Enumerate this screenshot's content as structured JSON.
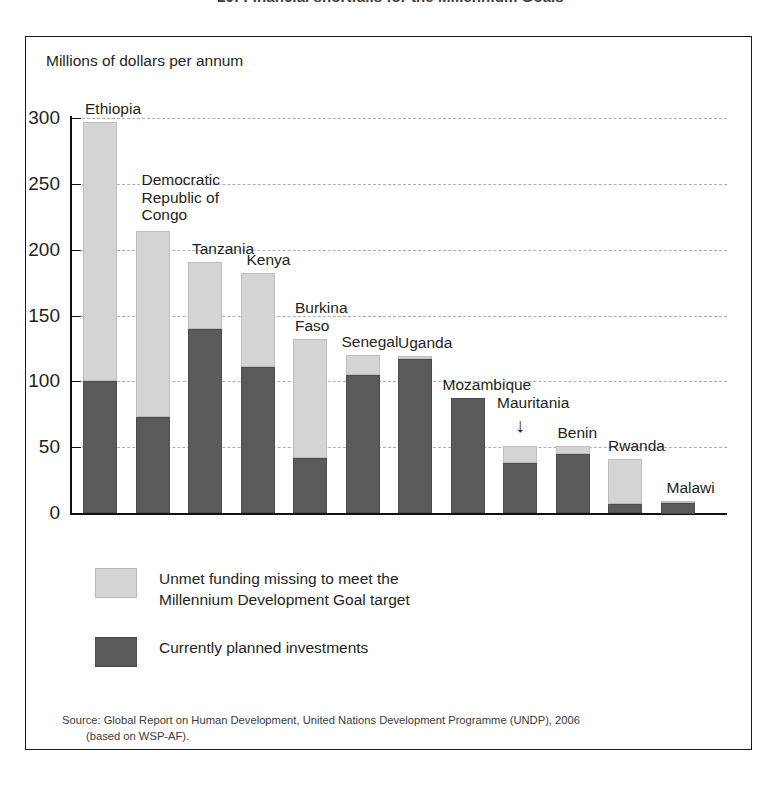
{
  "figure": {
    "title": "20: Financial shortfalls for the Millennium Goals",
    "axis_caption": "Millions of dollars per annum",
    "source_line1": "Source: Global Report on Human Development, United Nations Development Programme (UNDP), 2006",
    "source_line2": "(based on WSP-AF).",
    "annotation_arrow": "↓"
  },
  "legend": {
    "unmet_label": "Unmet funding missing to meet the\nMillennium Development Goal target",
    "planned_label": "Currently planned investments",
    "unmet_color": "#d4d4d4",
    "planned_color": "#5a5a5a"
  },
  "chart_data": {
    "type": "bar",
    "title": "20: Financial shortfalls for the Millennium Goals",
    "xlabel": "",
    "ylabel": "Millions of dollars per annum",
    "ylim": [
      0,
      300
    ],
    "yticks": [
      0,
      50,
      100,
      150,
      200,
      250,
      300
    ],
    "ytick_labels": [
      "0",
      "50",
      "100",
      "150",
      "200",
      "250",
      "300"
    ],
    "grid": true,
    "legend_position": "below-plot",
    "stacked": true,
    "categories": [
      "Ethiopia",
      "Democratic\nRepublic of\nCongo",
      "Tanzania",
      "Kenya",
      "Burkina\nFaso",
      "Senegal",
      "Uganda",
      "Mozambique",
      "Mauritania",
      "Benin",
      "Rwanda",
      "Malawi"
    ],
    "series": [
      {
        "name": "Currently planned investments",
        "color": "#5a5a5a",
        "values": [
          100,
          73,
          140,
          111,
          42,
          105,
          117,
          87,
          38,
          45,
          7,
          8
        ]
      },
      {
        "name": "Unmet funding missing to meet the Millennium Development Goal target",
        "color": "#d4d4d4",
        "values": [
          197,
          141,
          51,
          71,
          90,
          15,
          2,
          0,
          13,
          6,
          34,
          1
        ]
      }
    ],
    "totals": [
      297,
      214,
      191,
      182,
      132,
      120,
      119,
      87,
      51,
      51,
      41,
      9
    ],
    "annotations": [
      {
        "text": "↓",
        "target": "Mauritania",
        "note": "arrow pointing to Mauritania bar"
      }
    ]
  }
}
